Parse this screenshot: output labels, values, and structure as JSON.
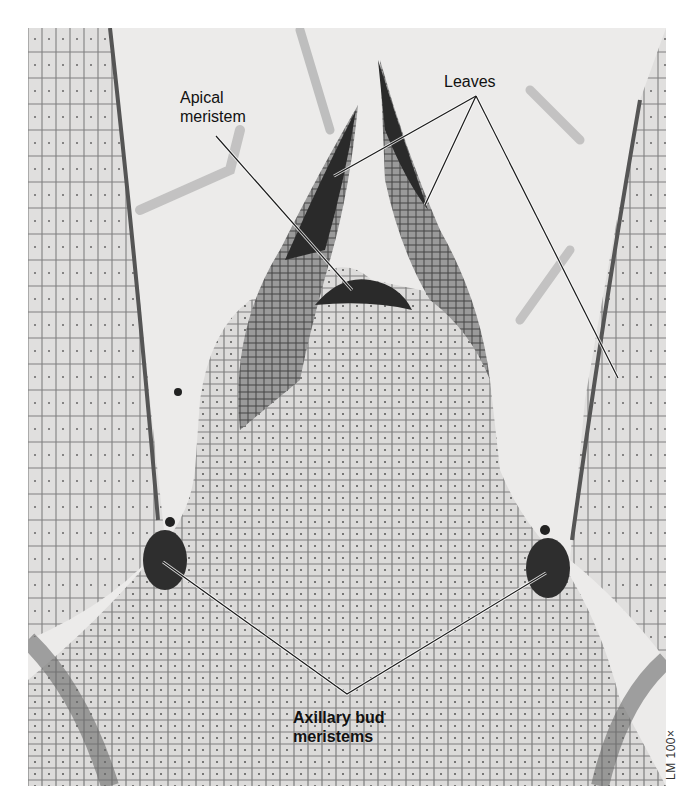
{
  "figure": {
    "type": "light micrograph",
    "magnification_caption": "LM 100×",
    "labels": {
      "apical_meristem": {
        "line1": "Apical",
        "line2": "meristem"
      },
      "leaves": "Leaves",
      "axillary_bud_meristems": {
        "line1": "Axillary bud",
        "line2": "meristems"
      }
    },
    "leader_lines": {
      "apical_meristem": [
        [
          216,
          136
        ],
        [
          352,
          290
        ]
      ],
      "leaves": [
        [
          [
            476,
            96
          ],
          [
            334,
            176
          ]
        ],
        [
          [
            476,
            96
          ],
          [
            425,
            205
          ]
        ],
        [
          [
            476,
            96
          ],
          [
            618,
            378
          ]
        ]
      ],
      "axillary_bud_meristems": [
        [
          [
            163,
            562
          ],
          [
            347,
            694
          ]
        ],
        [
          [
            347,
            694
          ],
          [
            546,
            573
          ]
        ]
      ]
    },
    "colors": {
      "background": "#ecebea",
      "tissue_dark": "#2a2a2a",
      "tissue_mid": "#8a8a8a",
      "tissue_light": "#d2d2d2",
      "label_text": "#111111",
      "leader_line": "#1a1a1a"
    }
  }
}
